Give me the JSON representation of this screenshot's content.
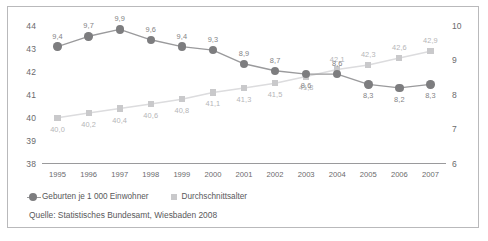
{
  "chart_data": {
    "type": "line",
    "title": "",
    "subtitle": "",
    "xlabel": "",
    "ylabel": "",
    "grid": false,
    "legend_position": "bottom-left",
    "categories": [
      "1995",
      "1996",
      "1997",
      "1998",
      "1999",
      "2000",
      "2001",
      "2002",
      "2003",
      "2004",
      "2005",
      "2006",
      "2007"
    ],
    "axes": {
      "left": {
        "ticks": [
          "44",
          "43",
          "42",
          "41",
          "40",
          "39",
          "38"
        ],
        "ylim": [
          38,
          44
        ],
        "series": "Durchschnittsalter"
      },
      "right": {
        "ticks": [
          "10",
          "9",
          "8",
          "7",
          "6"
        ],
        "ylim": [
          6,
          10
        ],
        "series": "Geburten je 1 000 Einwohner"
      }
    },
    "series": [
      {
        "name": "Geburten je 1 000 Einwohner",
        "axis": "right",
        "marker": "circle",
        "color": "#7d7d7f",
        "values": [
          9.4,
          9.7,
          9.9,
          9.6,
          9.4,
          9.3,
          8.9,
          8.7,
          8.6,
          8.6,
          8.3,
          8.2,
          8.3
        ],
        "labels": [
          "9,4",
          "9,7",
          "9,9",
          "9,6",
          "9,4",
          "9,3",
          "8,9",
          "8,7",
          "8,6",
          "8,6",
          "8,3",
          "8,2",
          "8,3"
        ]
      },
      {
        "name": "Durchschnittsalter",
        "axis": "left",
        "marker": "square",
        "color": "#c9c9cb",
        "values": [
          40.0,
          40.2,
          40.4,
          40.6,
          40.8,
          41.1,
          41.3,
          41.5,
          41.8,
          42.1,
          42.3,
          42.6,
          42.9
        ],
        "labels": [
          "40,0",
          "40,2",
          "40,4",
          "40,6",
          "40,8",
          "41,1",
          "41,3",
          "41,5",
          "41,8",
          "42,1",
          "42,3",
          "42,6",
          "42,9"
        ]
      }
    ],
    "source": "Quelle: Statistisches Bundesamt, Wiesbaden 2008"
  },
  "legend": {
    "births_label": "Geburten je 1 000 Einwohner",
    "age_label": "Durchschnittsalter"
  },
  "source_note": "Quelle: Statistisches Bundesamt, Wiesbaden 2008",
  "colors": {
    "births": "#7d7d7f",
    "age": "#c9c9cb",
    "text": "#58585a",
    "axis": "#9a9a9c",
    "frame": "#b9b9bb"
  }
}
